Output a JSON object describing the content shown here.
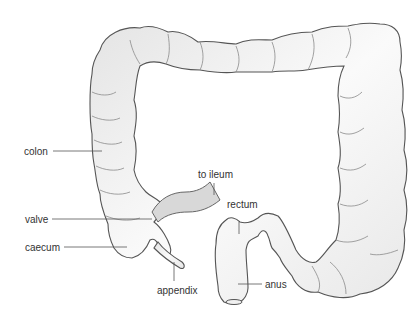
{
  "diagram": {
    "labels": {
      "colon": "colon",
      "to_ileum": "to ileum",
      "valve": "valve",
      "rectum": "rectum",
      "caecum": "caecum",
      "appendix": "appendix",
      "anus": "anus"
    },
    "colors": {
      "outline": "#555555",
      "fill": "#f4f4f4",
      "shade": "#d6d6d6",
      "ileum": "#d8d8d8",
      "text": "#333333",
      "background": "#ffffff"
    }
  }
}
